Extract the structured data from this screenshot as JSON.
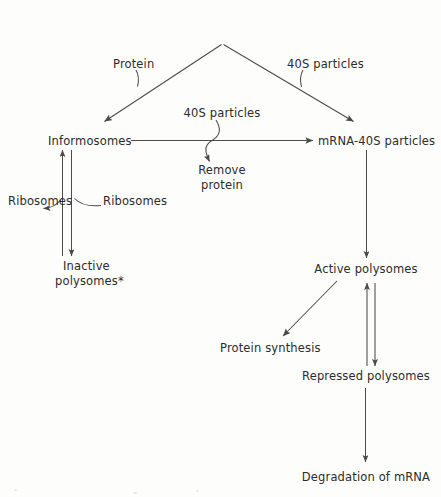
{
  "diagram": {
    "title_line1": "Synthesis of mRNA",
    "title_line2": "in the nucleus",
    "nodes": {
      "synthesis": "Synthesis of mRNA in the nucleus",
      "protein": "Protein",
      "forty_s_particles_right": "40S particles",
      "forty_s_particles_mid": "40S particles",
      "informosomes": "Informosomes",
      "mrna_40s_particles": "mRNA-40S particles",
      "remove_line1": "Remove",
      "remove_line2": "protein",
      "ribosomes_left": "Ribosomes",
      "ribosomes_right": "Ribosomes",
      "inactive_line1": "Inactive",
      "inactive_line2": "polysomes*",
      "active_polysomes": "Active polysomes",
      "protein_synthesis": "Protein synthesis",
      "repressed_polysomes": "Repressed polysomes",
      "degradation": "Degradation of mRNA"
    },
    "colors": {
      "ink": "#2b2b2b",
      "stroke": "#4a4a4a",
      "background": "#fdfdfb"
    }
  }
}
